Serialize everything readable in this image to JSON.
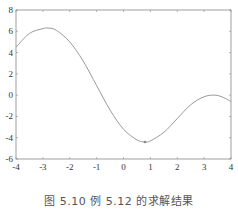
{
  "figure": {
    "caption": "图 5.10   例 5.12 的求解结果"
  },
  "chart_data": {
    "type": "line",
    "title": "",
    "xlabel": "",
    "ylabel": "",
    "xlim": [
      -4,
      4
    ],
    "ylim": [
      -6,
      8
    ],
    "xticks": [
      -4,
      -3,
      -2,
      -1,
      0,
      1,
      2,
      3,
      4
    ],
    "yticks": [
      -6,
      -4,
      -2,
      0,
      2,
      4,
      6,
      8
    ],
    "grid": false,
    "legend": null,
    "series": [
      {
        "name": "f(x)",
        "color": "#999999",
        "x": [
          -4.0,
          -3.5,
          -3.0,
          -2.8,
          -2.5,
          -2.0,
          -1.5,
          -1.0,
          -0.5,
          0.0,
          0.5,
          0.8,
          1.0,
          1.5,
          2.0,
          2.5,
          3.0,
          3.4,
          3.7,
          4.0
        ],
        "y": [
          4.5,
          5.8,
          6.25,
          6.3,
          6.1,
          5.0,
          3.2,
          0.9,
          -1.4,
          -3.2,
          -4.2,
          -4.4,
          -4.3,
          -3.5,
          -2.2,
          -0.9,
          -0.15,
          0.0,
          -0.2,
          -0.6
        ]
      }
    ],
    "annotations": [
      {
        "type": "marker",
        "x": 0.8,
        "y": -4.4,
        "label": "minimum point"
      }
    ]
  }
}
